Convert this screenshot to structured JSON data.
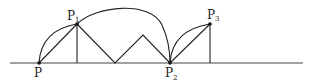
{
  "diagram": {
    "type": "geometry-path",
    "colors": {
      "stroke": "#222222",
      "background": "#ffffff"
    },
    "baseline": {
      "x1": 10,
      "x2": 303,
      "y": 63
    },
    "points": [
      {
        "id": "P",
        "label": "P",
        "subscript": "",
        "x": 39,
        "y": 63
      },
      {
        "id": "P1",
        "label": "P",
        "subscript": "1",
        "x": 77,
        "y": 24
      },
      {
        "id": "P2",
        "label": "P",
        "subscript": "2",
        "x": 170,
        "y": 63
      },
      {
        "id": "P3",
        "label": "P",
        "subscript": "3",
        "x": 210,
        "y": 24
      }
    ],
    "labels": {
      "p": "P",
      "p1_main": "P",
      "p1_sub": "1",
      "p2_main": "P",
      "p2_sub": "2",
      "p3_main": "P",
      "p3_sub": "3"
    }
  }
}
